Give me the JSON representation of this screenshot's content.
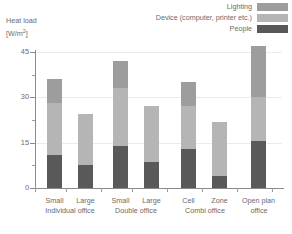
{
  "axis": {
    "y_label_line1": "Heat load",
    "y_label_line2_pre": "[W/m",
    "y_label_line2_sup": "2",
    "y_label_line2_post": "]",
    "y_ticks": [
      "0",
      "15",
      "30",
      "45"
    ]
  },
  "legend": {
    "items": [
      {
        "label": "Lighting",
        "color": "#9d9d9d"
      },
      {
        "label": "Device (computer, printer etc.)",
        "color": "#b5b5b5"
      },
      {
        "label": "People",
        "color": "#595959"
      }
    ]
  },
  "chart_data": {
    "type": "bar",
    "stacked": true,
    "title": "",
    "xlabel": "",
    "ylabel": "Heat load [W/m2]",
    "ylim": [
      0,
      48
    ],
    "yticks": [
      0,
      15,
      30,
      45
    ],
    "yticks_minor": [
      7.5,
      22.5,
      37.5
    ],
    "grid": true,
    "legend_position": "top-right",
    "categories": [
      "Small",
      "Large",
      "Small",
      "Large",
      "Cell",
      "Zone",
      "Open plan"
    ],
    "groups": [
      {
        "name": "Individual office",
        "categories": [
          "Small",
          "Large"
        ]
      },
      {
        "name": "Double office",
        "categories": [
          "Small",
          "Large"
        ]
      },
      {
        "name": "Combi office",
        "categories": [
          "Cell",
          "Zone"
        ]
      },
      {
        "name": "Open plan office",
        "categories": [
          "Open plan"
        ]
      }
    ],
    "series": [
      {
        "name": "People",
        "color": "#595959",
        "values": [
          11.0,
          7.5,
          14.0,
          8.5,
          13.0,
          4.0,
          15.5
        ]
      },
      {
        "name": "Device (computer, printer etc.)",
        "color": "#b5b5b5",
        "values": [
          17.0,
          17.0,
          19.0,
          18.5,
          14.0,
          18.0,
          14.5
        ]
      },
      {
        "name": "Lighting",
        "color": "#9d9d9d",
        "values": [
          8.0,
          0.0,
          9.0,
          0.0,
          8.0,
          0.0,
          17.0
        ]
      }
    ],
    "totals": [
      36.0,
      24.5,
      42.0,
      27.0,
      35.0,
      22.0,
      47.0
    ]
  }
}
